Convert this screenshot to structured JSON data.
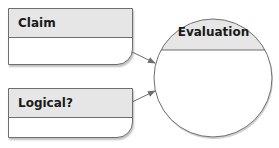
{
  "diagram": {
    "boxes": [
      {
        "id": "claim",
        "label": "Claim",
        "body": ""
      },
      {
        "id": "logical",
        "label": "Logical?",
        "body": ""
      }
    ],
    "circle": {
      "label": "Evaluation",
      "body": ""
    },
    "arrows": [
      {
        "from": "claim",
        "to": "evaluation"
      },
      {
        "from": "logical",
        "to": "evaluation"
      }
    ],
    "colors": {
      "header_fill": "#e6e6e6",
      "stroke": "#6e6e6e",
      "body_fill": "#ffffff"
    }
  }
}
